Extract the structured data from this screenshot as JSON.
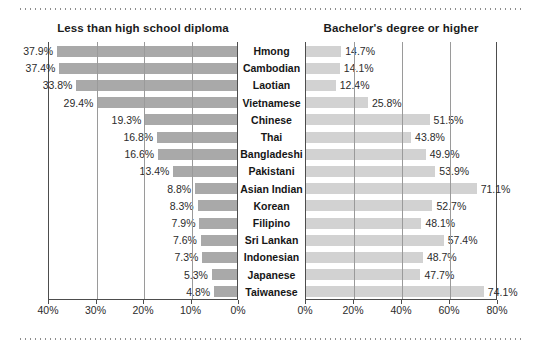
{
  "figure": {
    "left_panel_title": "Less than high school diploma",
    "right_panel_title": "Bachelor's degree or higher"
  },
  "chart_data": {
    "type": "bar",
    "orientation": "horizontal",
    "layout": "back-to-back population pyramid, two panels sharing centered category labels",
    "title": "",
    "categories": [
      "Hmong",
      "Cambodian",
      "Laotian",
      "Vietnamese",
      "Chinese",
      "Thai",
      "Bangladeshi",
      "Pakistani",
      "Asian Indian",
      "Korean",
      "Filipino",
      "Sri Lankan",
      "Indonesian",
      "Japanese",
      "Taiwanese"
    ],
    "series": [
      {
        "name": "Less than high school diploma",
        "panel": "left",
        "direction": "right-to-left",
        "color": "#a9a9a9",
        "axis_ticks": [
          "40%",
          "30%",
          "20%",
          "10%",
          "0%"
        ],
        "axis_tick_values": [
          40,
          30,
          20,
          10,
          0
        ],
        "xlim": [
          40,
          0
        ],
        "values": [
          37.9,
          37.4,
          33.8,
          29.4,
          19.3,
          16.8,
          16.6,
          13.4,
          8.8,
          8.3,
          7.9,
          7.6,
          7.3,
          5.3,
          4.8
        ],
        "value_labels": [
          "37.9%",
          "37.4%",
          "33.8%",
          "29.4%",
          "19.3%",
          "16.8%",
          "16.6%",
          "13.4%",
          "8.8%",
          "8.3%",
          "7.9%",
          "7.6%",
          "7.3%",
          "5.3%",
          "4.8%"
        ]
      },
      {
        "name": "Bachelor's degree or higher",
        "panel": "right",
        "direction": "left-to-right",
        "color": "#d2d2d2",
        "axis_ticks": [
          "0%",
          "20%",
          "40%",
          "60%",
          "80%"
        ],
        "axis_tick_values": [
          0,
          20,
          40,
          60,
          80
        ],
        "xlim": [
          0,
          80
        ],
        "values": [
          14.7,
          14.1,
          12.4,
          25.8,
          51.5,
          43.8,
          49.9,
          53.9,
          71.1,
          52.7,
          48.1,
          57.4,
          48.7,
          47.7,
          74.1
        ],
        "value_labels": [
          "14.7%",
          "14.1%",
          "12.4%",
          "25.8%",
          "51.5%",
          "43.8%",
          "49.9%",
          "53.9%",
          "71.1%",
          "52.7%",
          "48.1%",
          "57.4%",
          "48.7%",
          "47.7%",
          "74.1%"
        ]
      }
    ],
    "xlabel": "",
    "ylabel": "",
    "grid": true,
    "legend": "none"
  }
}
